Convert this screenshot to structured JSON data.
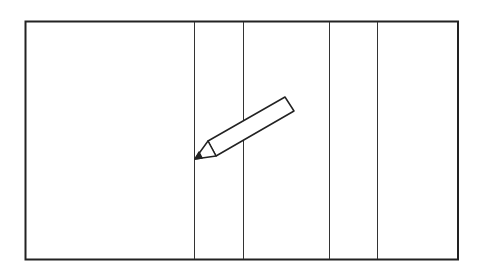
{
  "diagram": {
    "colors": {
      "stroke": "#222222",
      "background": "#ffffff"
    },
    "frame": {
      "x": 25,
      "y": 22,
      "width": 433,
      "height": 238
    },
    "dividers_x": [
      194,
      243,
      329,
      377
    ],
    "pencil": {
      "icon": "pencil-icon",
      "tip": [
        195,
        159
      ],
      "end": [
        294,
        97
      ]
    }
  }
}
